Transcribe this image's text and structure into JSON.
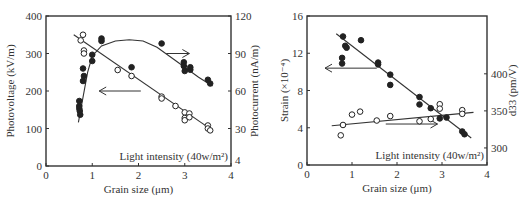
{
  "chart_data": [
    {
      "type": "scatter",
      "title": "",
      "xlabel": "Grain size (μm)",
      "ylabel": "Photovoltage (kV/m)",
      "ylabel_right": "Photocurrent (nA/m)",
      "xlim": [
        0,
        4
      ],
      "ylim": [
        0,
        400
      ],
      "ylim_right": [
        0,
        120
      ],
      "xticks": [
        "0",
        "1",
        "2",
        "3",
        "4"
      ],
      "yticks": [
        "0",
        "100",
        "200",
        "300",
        "400"
      ],
      "yticks_right": [
        "30",
        "60",
        "90",
        "120"
      ],
      "yticks_right_values": [
        30,
        60,
        90,
        120
      ],
      "corner_label_right": "4",
      "annotation": "Light intensity (40w/m²)",
      "grid": false,
      "series": [
        {
          "name": "Photovoltage",
          "axis": "left",
          "marker": "open-circle",
          "points": [
            [
              0.8,
              350
            ],
            [
              0.75,
              335
            ],
            [
              0.82,
              308
            ],
            [
              0.82,
              300
            ],
            [
              1.55,
              256
            ],
            [
              1.85,
              240
            ],
            [
              2.5,
              185
            ],
            [
              2.5,
              180
            ],
            [
              2.8,
              160
            ],
            [
              3.0,
              143
            ],
            [
              3.0,
              128
            ],
            [
              3.0,
              122
            ],
            [
              3.1,
              140
            ],
            [
              3.1,
              130
            ],
            [
              3.5,
              108
            ],
            [
              3.5,
              100
            ],
            [
              3.55,
              95
            ]
          ],
          "fit": {
            "kind": "line",
            "from": [
              0.6,
              350
            ],
            "to": [
              3.6,
              95
            ]
          }
        },
        {
          "name": "Photocurrent",
          "axis": "right",
          "marker": "filled-circle",
          "points": [
            [
              0.72,
              52
            ],
            [
              0.72,
              48
            ],
            [
              0.72,
              46
            ],
            [
              0.73,
              44
            ],
            [
              0.74,
              41
            ],
            [
              0.8,
              78
            ],
            [
              0.82,
              72
            ],
            [
              0.8,
              68
            ],
            [
              1.0,
              84
            ],
            [
              1.0,
              89
            ],
            [
              1.2,
              102
            ],
            [
              1.2,
              100
            ],
            [
              1.85,
              79
            ],
            [
              2.5,
              98
            ],
            [
              2.98,
              83
            ],
            [
              2.98,
              80
            ],
            [
              3.0,
              76
            ],
            [
              3.12,
              79
            ],
            [
              3.12,
              77
            ],
            [
              3.5,
              69
            ],
            [
              3.55,
              66
            ]
          ],
          "fit": {
            "kind": "curve",
            "points": [
              [
                0.7,
                35
              ],
              [
                0.8,
                55
              ],
              [
                0.9,
                75
              ],
              [
                1.0,
                88
              ],
              [
                1.2,
                96
              ],
              [
                1.5,
                100
              ],
              [
                1.8,
                101
              ],
              [
                2.1,
                100
              ],
              [
                2.4,
                95
              ],
              [
                2.7,
                87
              ],
              [
                3.0,
                79
              ],
              [
                3.3,
                71
              ],
              [
                3.6,
                64
              ]
            ]
          }
        }
      ],
      "arrows": [
        {
          "direction": "left",
          "from": [
            2.05,
            200
          ],
          "to": [
            1.15,
            200
          ],
          "axis": "left"
        },
        {
          "direction": "right",
          "from": [
            2.6,
            90
          ],
          "to": [
            3.1,
            90
          ],
          "axis": "right"
        }
      ]
    },
    {
      "type": "scatter",
      "title": "",
      "xlabel": "Grain size (μm)",
      "ylabel": "Strain (×10⁻⁴)",
      "ylabel_right": "d33 (pm/V)",
      "xlim": [
        0,
        4
      ],
      "ylim": [
        0,
        16
      ],
      "ylim_right": [
        277,
        478
      ],
      "xticks": [
        "0",
        "1",
        "2",
        "3",
        "4"
      ],
      "yticks": [
        "0",
        "4",
        "8",
        "12",
        "16"
      ],
      "yticks_right": [
        "300",
        "350",
        "400"
      ],
      "yticks_right_values": [
        300,
        350,
        400
      ],
      "annotation": "Light intensity (40w/m²)",
      "grid": false,
      "series": [
        {
          "name": "Strain",
          "axis": "left",
          "marker": "filled-circle",
          "points": [
            [
              0.8,
              13.8
            ],
            [
              0.85,
              12.8
            ],
            [
              0.88,
              12.6
            ],
            [
              0.78,
              11.5
            ],
            [
              0.78,
              10.9
            ],
            [
              1.2,
              13.4
            ],
            [
              1.58,
              11.0
            ],
            [
              1.58,
              10.8
            ],
            [
              1.85,
              9.7
            ],
            [
              1.85,
              8.6
            ],
            [
              2.5,
              7.3
            ],
            [
              2.5,
              6.5
            ],
            [
              2.75,
              6.1
            ],
            [
              2.95,
              5.0
            ],
            [
              3.1,
              5.1
            ],
            [
              3.45,
              3.6
            ],
            [
              3.5,
              3.3
            ]
          ],
          "fit": {
            "kind": "line",
            "from": [
              0.65,
              14.1
            ],
            "to": [
              3.65,
              2.9
            ]
          }
        },
        {
          "name": "d33",
          "axis": "right",
          "marker": "open-circle",
          "points": [
            [
              0.75,
              317
            ],
            [
              0.8,
              331
            ],
            [
              1.0,
              345
            ],
            [
              1.18,
              349
            ],
            [
              1.55,
              337
            ],
            [
              1.85,
              343
            ],
            [
              2.5,
              336
            ],
            [
              2.75,
              339
            ],
            [
              2.95,
              359
            ],
            [
              2.95,
              353
            ],
            [
              3.45,
              351
            ],
            [
              3.45,
              346
            ]
          ],
          "fit": {
            "kind": "line",
            "from": [
              0.55,
              330
            ],
            "to": [
              3.7,
              348
            ]
          }
        }
      ],
      "arrows": [
        {
          "direction": "left",
          "from": [
            1.55,
            10.4
          ],
          "to": [
            0.4,
            10.4
          ],
          "axis": "left"
        },
        {
          "direction": "right",
          "from": [
            1.75,
            4.4
          ],
          "to": [
            2.9,
            4.4
          ],
          "axis": "left"
        }
      ]
    }
  ]
}
